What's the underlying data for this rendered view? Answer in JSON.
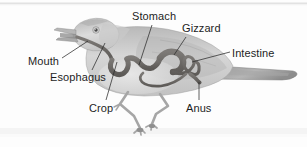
{
  "figure": {
    "kind": "anatomy-diagram",
    "background_color": "#fdfdfd",
    "label_color": "#1d1d1d",
    "leader_line_color": "#2b2b2b",
    "body_fill": "#cfcfcf",
    "body_shade": "#a8a8a8",
    "tract_color": "#6e6b68",
    "tract_dark": "#575451",
    "band_color": "#f0f0f0"
  },
  "labels": [
    {
      "id": "mouth",
      "text": "Mouth",
      "x": 28,
      "y": 55
    },
    {
      "id": "esophagus",
      "text": "Esophagus",
      "x": 50,
      "y": 71
    },
    {
      "id": "crop",
      "text": "Crop",
      "x": 89,
      "y": 102
    },
    {
      "id": "stomach",
      "text": "Stomach",
      "x": 132,
      "y": 10
    },
    {
      "id": "gizzard",
      "text": "Gizzard",
      "x": 182,
      "y": 22
    },
    {
      "id": "intestine",
      "text": "Intestine",
      "x": 232,
      "y": 47
    },
    {
      "id": "anus",
      "text": "Anus",
      "x": 186,
      "y": 102
    }
  ],
  "leaders": [
    {
      "id": "mouth-leader",
      "from": [
        62,
        58
      ],
      "to": [
        88,
        41
      ]
    },
    {
      "id": "esophagus-leader",
      "from": [
        92,
        70
      ],
      "to": [
        105,
        43
      ]
    },
    {
      "id": "crop-leader",
      "from": [
        106,
        100
      ],
      "to": [
        117,
        62
      ]
    },
    {
      "id": "stomach-leader",
      "from": [
        152,
        25
      ],
      "to": [
        139,
        65
      ]
    },
    {
      "id": "gizzard-leader",
      "from": [
        186,
        37
      ],
      "to": [
        174,
        55
      ]
    },
    {
      "id": "intestine-leader",
      "from": [
        230,
        52
      ],
      "to": [
        192,
        62
      ]
    },
    {
      "id": "anus-leader",
      "from": [
        199,
        100
      ],
      "to": [
        199,
        82
      ]
    }
  ],
  "parts": [
    {
      "id": "beak",
      "name": "open-beak"
    },
    {
      "id": "eye",
      "name": "bird-eye"
    },
    {
      "id": "head",
      "name": "bird-head"
    },
    {
      "id": "body",
      "name": "bird-body"
    },
    {
      "id": "tail",
      "name": "bird-tail"
    },
    {
      "id": "leg-front",
      "name": "bird-leg-front"
    },
    {
      "id": "leg-back",
      "name": "bird-leg-back"
    },
    {
      "id": "tract",
      "name": "digestive-tract"
    }
  ]
}
